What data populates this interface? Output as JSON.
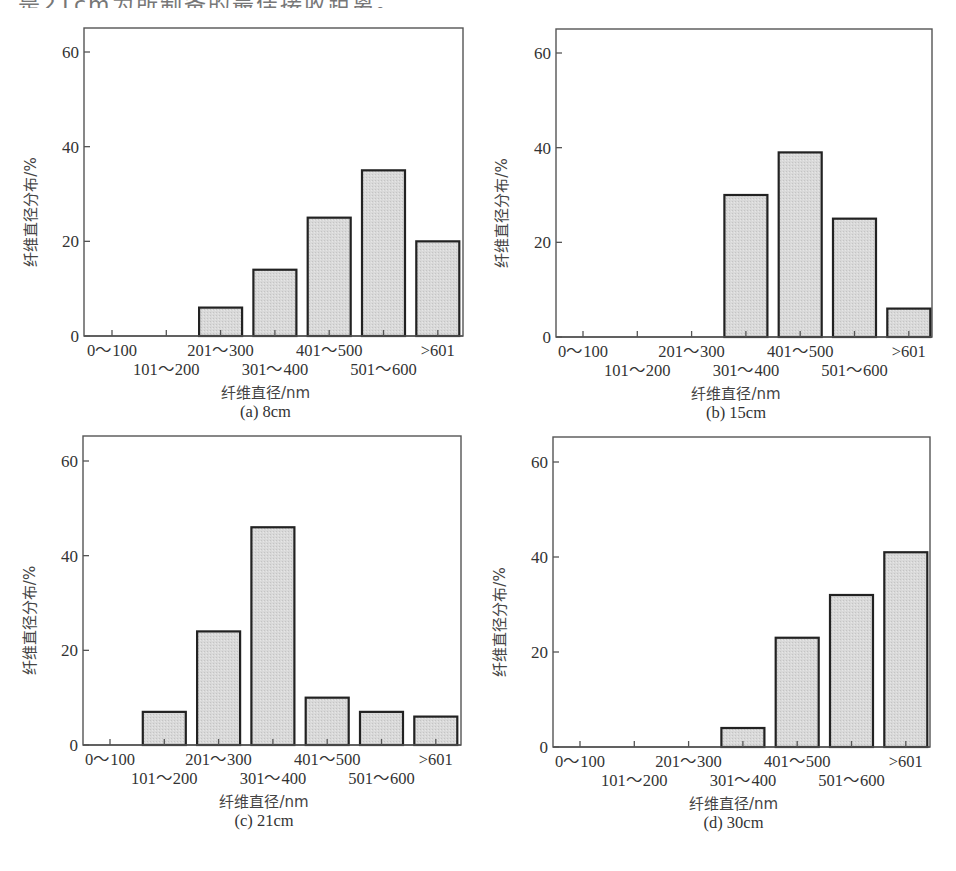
{
  "header_text": "是21cm为所制备的最佳接收距离。",
  "colors": {
    "bar_fill": "#d9d9d9",
    "bar_stroke": "#222222",
    "axis": "#555555",
    "text": "#333333"
  },
  "panels": [
    {
      "caption": "(a) 8cm",
      "ylabel": "纤维直径分布/%",
      "xlabel": "纤维直径/nm"
    },
    {
      "caption": "(b) 15cm",
      "ylabel": "纤维直径分布/%",
      "xlabel": "纤维直径/nm"
    },
    {
      "caption": "(c) 21cm",
      "ylabel": "纤维直径分布/%",
      "xlabel": "纤维直径/nm"
    },
    {
      "caption": "(d) 30cm",
      "ylabel": "纤维直径分布/%",
      "xlabel": "纤维直径/nm"
    }
  ],
  "chart_data": [
    {
      "type": "bar",
      "title": "(a) 8cm",
      "xlabel": "纤维直径/nm",
      "ylabel": "纤维直径分布/%",
      "categories": [
        "0～100",
        "101～200",
        "201～300",
        "301～400",
        "401～500",
        "501～600",
        ">601"
      ],
      "values": [
        0,
        0,
        6,
        14,
        25,
        35,
        20
      ],
      "ylim": [
        0,
        65
      ],
      "yticks": [
        0,
        20,
        40,
        60
      ],
      "grid": false,
      "legend": null
    },
    {
      "type": "bar",
      "title": "(b) 15cm",
      "xlabel": "纤维直径/nm",
      "ylabel": "纤维直径分布/%",
      "categories": [
        "0～100",
        "101～200",
        "201～300",
        "301～400",
        "401～500",
        "501～600",
        ">601"
      ],
      "values": [
        0,
        0,
        0,
        30,
        39,
        25,
        6
      ],
      "ylim": [
        0,
        65
      ],
      "yticks": [
        0,
        20,
        40,
        60
      ],
      "grid": false,
      "legend": null
    },
    {
      "type": "bar",
      "title": "(c) 21cm",
      "xlabel": "纤维直径/nm",
      "ylabel": "纤维直径分布/%",
      "categories": [
        "0～100",
        "101～200",
        "201～300",
        "301～400",
        "401～500",
        "501～600",
        ">601"
      ],
      "values": [
        0,
        7,
        24,
        46,
        10,
        7,
        6
      ],
      "ylim": [
        0,
        65
      ],
      "yticks": [
        0,
        20,
        40,
        60
      ],
      "grid": false,
      "legend": null
    },
    {
      "type": "bar",
      "title": "(d) 30cm",
      "xlabel": "纤维直径/nm",
      "ylabel": "纤维直径分布/%",
      "categories": [
        "0～100",
        "101～200",
        "201～300",
        "301～400",
        "401～500",
        "501～600",
        ">601"
      ],
      "values": [
        0,
        0,
        0,
        4,
        23,
        32,
        41
      ],
      "ylim": [
        0,
        65
      ],
      "yticks": [
        0,
        20,
        40,
        60
      ],
      "grid": false,
      "legend": null
    }
  ]
}
